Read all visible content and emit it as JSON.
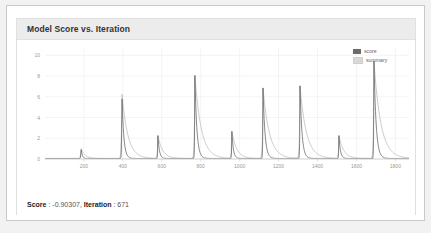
{
  "card": {
    "title": "Model Score vs. Iteration"
  },
  "status": {
    "score_key": "Score",
    "score_sep": " : ",
    "score_value": "-0.90307",
    "comma": ", ",
    "iteration_key": "Iteration",
    "iteration_sep": " : ",
    "iteration_value": "671"
  },
  "legend": {
    "items": [
      {
        "label": "score",
        "color": "#6b6b6b"
      },
      {
        "label": "summary",
        "color": "#d8d8d8"
      }
    ]
  },
  "colors": {
    "score_line": "#6b6b6b",
    "summary_line": "#bdbdbd",
    "grid": "#ededed",
    "axis": "#cccccc",
    "tick_text": "#999999",
    "header_bg": "#ececec",
    "card_border": "#e0e0e0",
    "frame_border": "#c9c9c9",
    "page_bg": "#f2f2f2"
  },
  "chart_data": {
    "type": "line",
    "title": "Model Score vs. Iteration",
    "xlabel": "",
    "ylabel": "",
    "xlim": [
      0,
      1870
    ],
    "ylim": [
      0,
      10.8
    ],
    "grid": true,
    "legend_position": "top-right",
    "xticks": [
      200,
      400,
      600,
      800,
      1000,
      1200,
      1400,
      1600,
      1800
    ],
    "yticks": [
      0,
      2,
      4,
      6,
      8,
      10
    ],
    "peaks": [
      {
        "x": 185,
        "height": 1.0,
        "decay": 14
      },
      {
        "x": 395,
        "height": 6.4,
        "decay": 22
      },
      {
        "x": 580,
        "height": 2.2,
        "decay": 18
      },
      {
        "x": 770,
        "height": 8.0,
        "decay": 24
      },
      {
        "x": 960,
        "height": 2.6,
        "decay": 18
      },
      {
        "x": 1120,
        "height": 6.8,
        "decay": 24
      },
      {
        "x": 1310,
        "height": 7.0,
        "decay": 24
      },
      {
        "x": 1510,
        "height": 2.2,
        "decay": 18
      },
      {
        "x": 1690,
        "height": 9.4,
        "decay": 26
      }
    ],
    "series": [
      {
        "name": "score",
        "color": "#6b6b6b",
        "description": "Sharp spikes with fast exponential decay at each restart iteration"
      },
      {
        "name": "summary",
        "color": "#bdbdbd",
        "description": "Smoothed envelope trailing each spike with slower decay"
      }
    ],
    "baseline": 0.05
  }
}
